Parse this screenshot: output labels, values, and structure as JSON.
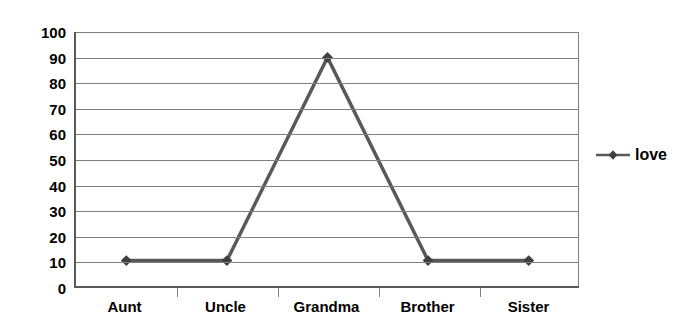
{
  "chart_data": {
    "type": "line",
    "title": "",
    "xlabel": "",
    "ylabel": "",
    "categories": [
      "Aunt",
      "Uncle",
      "Grandma",
      "Brother",
      "Sister"
    ],
    "series": [
      {
        "name": "love",
        "values": [
          10,
          10,
          90,
          10,
          10
        ],
        "color": "#595959",
        "marker": "diamond"
      }
    ],
    "ylim": [
      0,
      100
    ],
    "y_ticks": [
      0,
      10,
      20,
      30,
      40,
      50,
      60,
      70,
      80,
      90,
      100
    ],
    "y_tick_labels": [
      "0",
      "10",
      "20",
      "30",
      "40",
      "50",
      "60",
      "70",
      "80",
      "90",
      "100"
    ],
    "grid": true,
    "grid_axis": "y",
    "grid_color": "#7f7f7f",
    "legend": {
      "position": "right",
      "entries": [
        "love"
      ]
    },
    "axis_color": "#595959",
    "background": "#ffffff"
  }
}
